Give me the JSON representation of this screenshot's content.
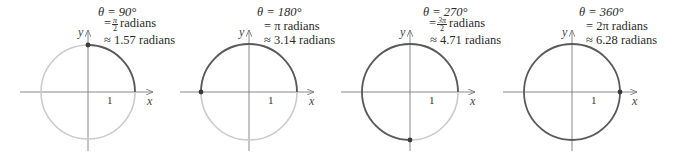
{
  "figure": {
    "colors": {
      "swept_arc": "#5a5a5a",
      "remaining_arc": "#cbcbcb",
      "axes": "#7a7a7a",
      "point": "#3a3a3a"
    },
    "axis_labels": {
      "x": "x",
      "y": "y",
      "unit_tick": "1"
    },
    "panels": [
      {
        "angle_deg": 90,
        "line1": "θ = 90°",
        "line2_prefix": "=",
        "line2_num": "π",
        "line2_den": "2",
        "line2_suffix": "radians",
        "line3": "≈ 1.57 radians"
      },
      {
        "angle_deg": 180,
        "line1": "θ = 180°",
        "line2_prefix": "=",
        "line2_text": "π radians",
        "line3": "≈ 3.14 radians"
      },
      {
        "angle_deg": 270,
        "line1": "θ = 270°",
        "line2_prefix": "=",
        "line2_num": "3π",
        "line2_den": "2",
        "line2_suffix": "radians",
        "line3": "≈ 4.71 radians"
      },
      {
        "angle_deg": 360,
        "line1": "θ = 360°",
        "line2_prefix": "=",
        "line2_text": "2π radians",
        "line3": "≈ 6.28 radians"
      }
    ]
  }
}
